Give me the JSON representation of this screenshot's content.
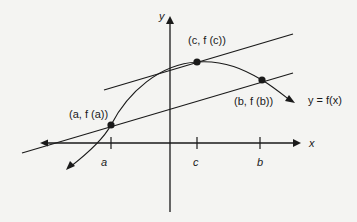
{
  "diagram": {
    "type": "mean-value-theorem",
    "axes": {
      "x_label": "x",
      "y_label": "y"
    },
    "function_label": "y = f(x)",
    "ticks": [
      {
        "label": "a"
      },
      {
        "label": "c"
      },
      {
        "label": "b"
      }
    ],
    "points": [
      {
        "label": "(a, f (a))"
      },
      {
        "label": "(c, f (c))"
      },
      {
        "label": "(b, f (b))"
      }
    ],
    "lines": [
      {
        "name": "tangent-at-c"
      },
      {
        "name": "secant-ab"
      }
    ],
    "colors": {
      "ink": "#1a1a1a",
      "background": "#f4f4f2"
    }
  }
}
